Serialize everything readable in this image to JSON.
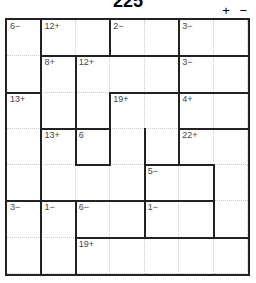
{
  "title": "225",
  "zoom_controls": {
    "plus": "+",
    "minus": "−"
  },
  "grid": {
    "size": 7,
    "clues": [
      {
        "r": 0,
        "c": 0,
        "text": "6−"
      },
      {
        "r": 0,
        "c": 1,
        "text": "12+"
      },
      {
        "r": 0,
        "c": 3,
        "text": "2−"
      },
      {
        "r": 0,
        "c": 5,
        "text": "3−"
      },
      {
        "r": 1,
        "c": 1,
        "text": "8+"
      },
      {
        "r": 1,
        "c": 2,
        "text": "12+"
      },
      {
        "r": 1,
        "c": 5,
        "text": "3−"
      },
      {
        "r": 2,
        "c": 0,
        "text": "13+"
      },
      {
        "r": 2,
        "c": 3,
        "text": "19+"
      },
      {
        "r": 2,
        "c": 5,
        "text": "4+"
      },
      {
        "r": 3,
        "c": 1,
        "text": "13+"
      },
      {
        "r": 3,
        "c": 2,
        "text": "6"
      },
      {
        "r": 3,
        "c": 5,
        "text": "22+"
      },
      {
        "r": 4,
        "c": 4,
        "text": "5−"
      },
      {
        "r": 5,
        "c": 0,
        "text": "3−"
      },
      {
        "r": 5,
        "c": 1,
        "text": "1−"
      },
      {
        "r": 5,
        "c": 2,
        "text": "6−"
      },
      {
        "r": 5,
        "c": 4,
        "text": "1−"
      },
      {
        "r": 6,
        "c": 2,
        "text": "19+"
      }
    ],
    "h_thick": [
      [
        1,
        1
      ],
      [
        1,
        2
      ],
      [
        1,
        3
      ],
      [
        1,
        4
      ],
      [
        1,
        5
      ],
      [
        1,
        6
      ],
      [
        2,
        0
      ],
      [
        2,
        3
      ],
      [
        2,
        4
      ],
      [
        2,
        5
      ],
      [
        2,
        6
      ],
      [
        3,
        1
      ],
      [
        3,
        2
      ],
      [
        3,
        5
      ],
      [
        3,
        6
      ],
      [
        4,
        2
      ],
      [
        4,
        4
      ],
      [
        4,
        5
      ],
      [
        5,
        0
      ],
      [
        5,
        1
      ],
      [
        5,
        2
      ],
      [
        5,
        3
      ],
      [
        5,
        4
      ],
      [
        5,
        5
      ],
      [
        6,
        2
      ],
      [
        6,
        3
      ],
      [
        6,
        4
      ],
      [
        6,
        5
      ],
      [
        6,
        6
      ]
    ],
    "v_thick": [
      [
        0,
        1
      ],
      [
        0,
        3
      ],
      [
        0,
        5
      ],
      [
        1,
        1
      ],
      [
        1,
        2
      ],
      [
        1,
        5
      ],
      [
        2,
        1
      ],
      [
        2,
        2
      ],
      [
        2,
        3
      ],
      [
        2,
        5
      ],
      [
        3,
        1
      ],
      [
        3,
        2
      ],
      [
        3,
        3
      ],
      [
        3,
        4
      ],
      [
        3,
        5
      ],
      [
        4,
        1
      ],
      [
        4,
        4
      ],
      [
        4,
        6
      ],
      [
        5,
        1
      ],
      [
        5,
        2
      ],
      [
        5,
        4
      ],
      [
        5,
        6
      ],
      [
        6,
        1
      ],
      [
        6,
        2
      ]
    ]
  }
}
